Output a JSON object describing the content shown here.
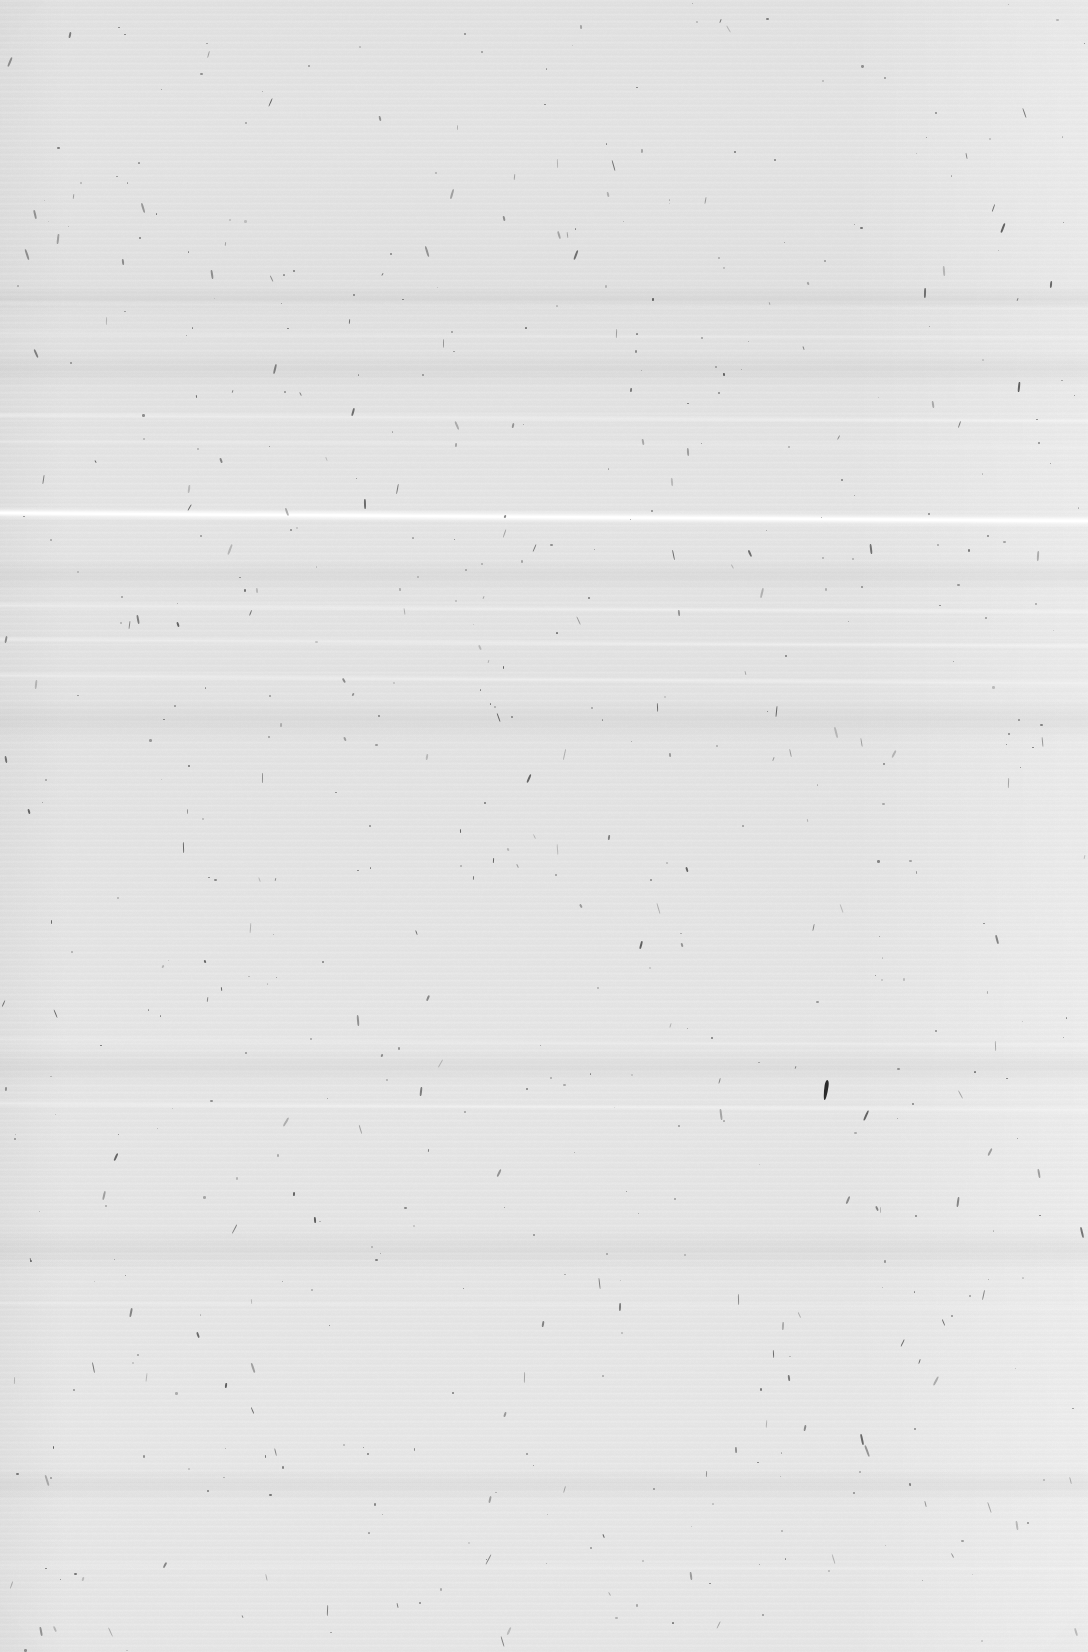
{
  "document": {
    "kind": "scanned-page",
    "description": "Blank scanned page",
    "content_text": "",
    "page_width": 1088,
    "page_height": 1652,
    "has_visible_text": false
  },
  "appearance": {
    "paper_color": "#e6e6e6",
    "paper_color_light": "#e9e9e9",
    "paper_color_dark": "#e3e3e3",
    "speck_color": "#4a4a4a",
    "fiber_color": "#3d3d3d",
    "streak_color": "#ffffff",
    "background_color": "#dcdcdc"
  },
  "artifacts": {
    "bright_streak": {
      "name": "primary-scan-streak",
      "y": 512,
      "slope_deg": 0.42,
      "color": "#ffffff",
      "intensity": "strong"
    },
    "faint_streaks": [
      {
        "y": 300,
        "slope_deg": 0.25,
        "intensity": "very-faint"
      },
      {
        "y": 330,
        "slope_deg": 0.25,
        "intensity": "very-faint"
      },
      {
        "y": 412,
        "slope_deg": 0.28,
        "intensity": "faint"
      },
      {
        "y": 438,
        "slope_deg": 0.28,
        "intensity": "very-faint"
      },
      {
        "y": 602,
        "slope_deg": 0.35,
        "intensity": "faint"
      },
      {
        "y": 636,
        "slope_deg": 0.35,
        "intensity": "faint"
      },
      {
        "y": 672,
        "slope_deg": 0.42,
        "intensity": "faint"
      },
      {
        "y": 1036,
        "slope_deg": 0.3,
        "intensity": "very-faint"
      },
      {
        "y": 1100,
        "slope_deg": 0.35,
        "intensity": "faint"
      },
      {
        "y": 1300,
        "slope_deg": 0.2,
        "intensity": "very-faint"
      },
      {
        "y": 1562,
        "slope_deg": 0.15,
        "intensity": "very-faint"
      }
    ],
    "dark_bands": [
      {
        "y": 286,
        "height": 26
      },
      {
        "y": 352,
        "height": 34
      },
      {
        "y": 560,
        "height": 30
      },
      {
        "y": 700,
        "height": 40
      },
      {
        "y": 1050,
        "height": 34
      },
      {
        "y": 1230,
        "height": 40
      },
      {
        "y": 1470,
        "height": 30
      }
    ],
    "major_fiber": {
      "name": "comma-fiber",
      "x": 824,
      "y": 1080,
      "width": 4,
      "height": 20,
      "rotation_deg": 8,
      "color": "#2a2a2a"
    }
  },
  "banding": {
    "period_px": 7,
    "orientation": "horizontal",
    "source": "scanner-ccd"
  }
}
